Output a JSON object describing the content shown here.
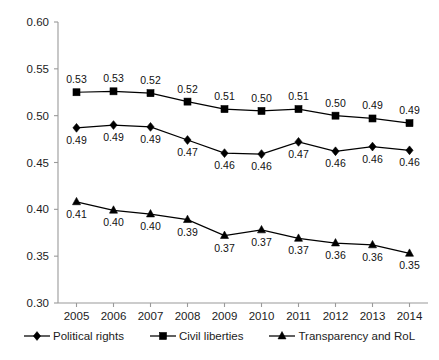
{
  "chart_data": {
    "type": "line",
    "title": "",
    "subtitle": "",
    "xlabel": "",
    "ylabel": "",
    "categories": [
      "2005",
      "2006",
      "2007",
      "2008",
      "2009",
      "2010",
      "2011",
      "2012",
      "2013",
      "2014"
    ],
    "ylim": [
      0.3,
      0.6
    ],
    "ytick_labels": [
      "0.60",
      "0.55",
      "0.50",
      "0.45",
      "0.40",
      "0.35",
      "0.30"
    ],
    "ytick_values": [
      0.6,
      0.55,
      0.5,
      0.45,
      0.4,
      0.35,
      0.3
    ],
    "grid": false,
    "legend_position": "bottom",
    "data_labels": true,
    "series": [
      {
        "name": "Political rights",
        "marker": "diamond",
        "values": [
          0.487,
          0.49,
          0.488,
          0.474,
          0.46,
          0.459,
          0.472,
          0.462,
          0.467,
          0.463
        ],
        "labels": [
          "0.49",
          "0.49",
          "0.49",
          "0.47",
          "0.46",
          "0.46",
          "0.47",
          "0.46",
          "0.46",
          "0.46"
        ],
        "label_positions": [
          "below",
          "below",
          "below",
          "below",
          "below",
          "below",
          "below",
          "below",
          "below",
          "below"
        ]
      },
      {
        "name": "Civil liberties",
        "marker": "square",
        "values": [
          0.525,
          0.526,
          0.524,
          0.515,
          0.507,
          0.505,
          0.507,
          0.5,
          0.497,
          0.492
        ],
        "labels": [
          "0.53",
          "0.53",
          "0.52",
          "0.52",
          "0.51",
          "0.50",
          "0.51",
          "0.50",
          "0.49",
          "0.49"
        ],
        "label_positions": [
          "above",
          "above",
          "above",
          "above",
          "above",
          "above",
          "above",
          "above",
          "above",
          "above"
        ]
      },
      {
        "name": "Transparency and RoL",
        "marker": "triangle",
        "values": [
          0.408,
          0.399,
          0.395,
          0.389,
          0.372,
          0.378,
          0.369,
          0.364,
          0.362,
          0.353
        ],
        "labels": [
          "0.41",
          "0.40",
          "0.40",
          "0.39",
          "0.37",
          "0.37",
          "0.37",
          "0.36",
          "0.36",
          "0.35"
        ],
        "label_positions": [
          "below",
          "below",
          "below",
          "below",
          "below",
          "below",
          "below",
          "below",
          "below",
          "below"
        ]
      }
    ],
    "colors": {
      "series_line": "#000000",
      "marker": "#000000",
      "axis": "#9a9a9a",
      "text": "#1c1c1c",
      "background": "#ffffff"
    }
  },
  "legend": {
    "items": [
      {
        "label": "Political rights",
        "marker": "diamond"
      },
      {
        "label": "Civil liberties",
        "marker": "square"
      },
      {
        "label": "Transparency and RoL",
        "marker": "triangle"
      }
    ]
  }
}
